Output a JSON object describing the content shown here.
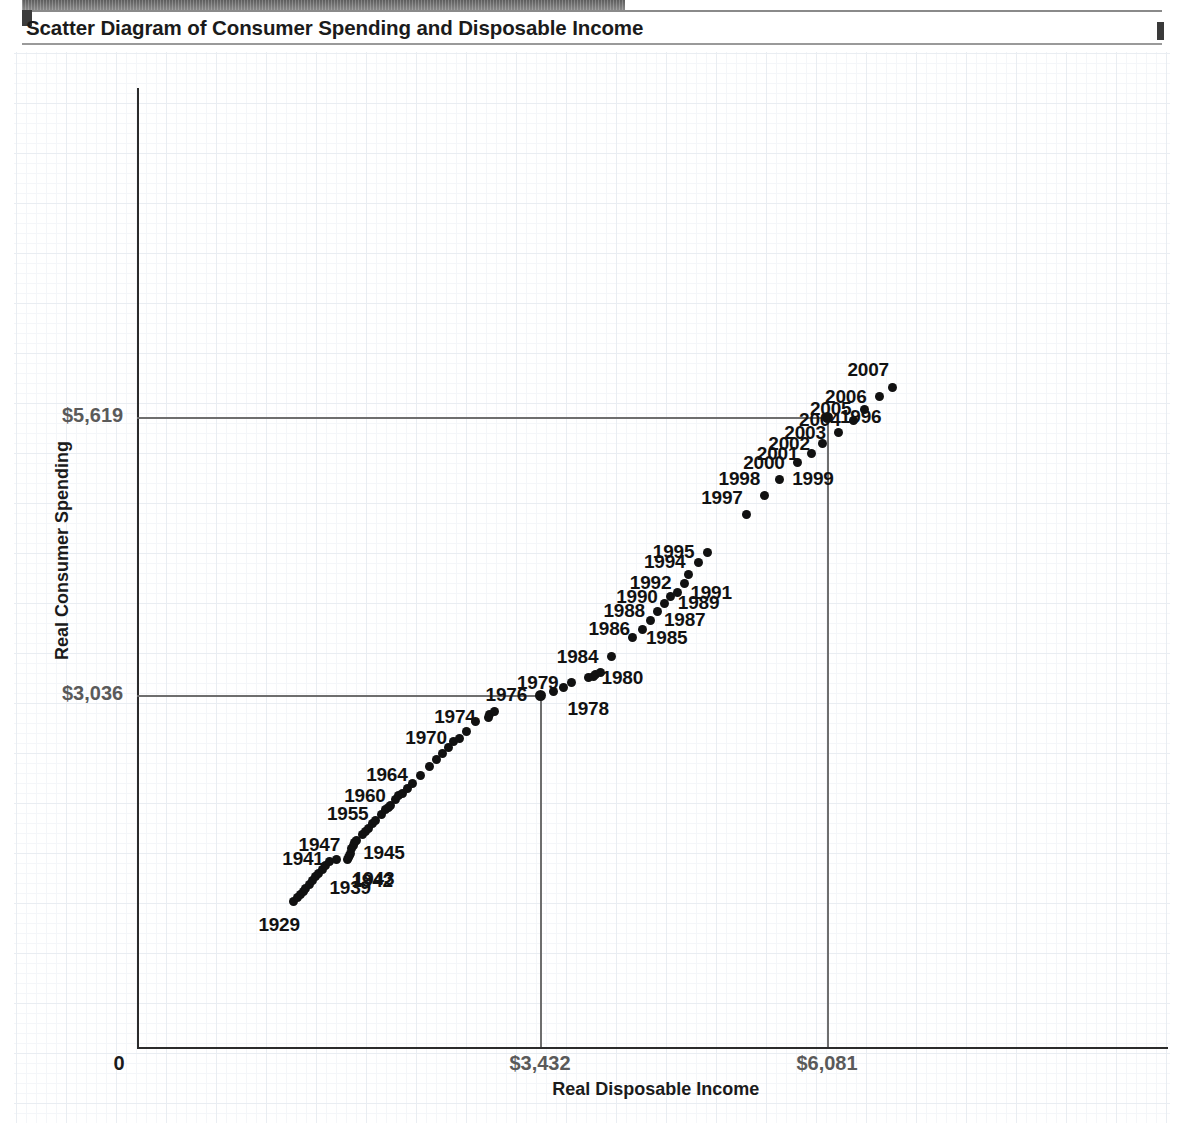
{
  "page": {
    "title": "Scatter Diagram of Consumer Spending and Disposable Income"
  },
  "chart_data": {
    "type": "scatter",
    "title": "Scatter Diagram of Consumer Spending and Disposable Income",
    "xlabel": "Real Disposable Income",
    "ylabel": "Real Consumer Spending",
    "grid": true,
    "legend": "none",
    "xticks": [
      "0",
      "$3,432",
      "$6,081"
    ],
    "xtick_values": [
      0,
      3432,
      6081
    ],
    "yticks": [
      "$3,036",
      "$5,619"
    ],
    "ytick_values": [
      3036,
      5619
    ],
    "xlim": [
      0,
      7400
    ],
    "ylim": [
      0,
      7000
    ],
    "reference_lines": {
      "x": [
        3432,
        6081
      ],
      "y": [
        3036,
        5619
      ]
    },
    "point_color": "#111111",
    "axis_color": "#2b2b2b",
    "grid_color": "#e9edf2",
    "tick_label_color": "#5a5a5a",
    "points": [
      {
        "label": "1929",
        "labeled": true,
        "x": 1160,
        "y": 1118,
        "label_pos": "below-left"
      },
      {
        "label": "1930",
        "labeled": false,
        "x": 1190,
        "y": 1150
      },
      {
        "label": "1931",
        "labeled": false,
        "x": 1218,
        "y": 1180
      },
      {
        "label": "1932",
        "labeled": false,
        "x": 1245,
        "y": 1210
      },
      {
        "label": "1933",
        "labeled": false,
        "x": 1272,
        "y": 1240
      },
      {
        "label": "1934",
        "labeled": false,
        "x": 1300,
        "y": 1275
      },
      {
        "label": "1935",
        "labeled": false,
        "x": 1330,
        "y": 1310
      },
      {
        "label": "1936",
        "labeled": false,
        "x": 1362,
        "y": 1348
      },
      {
        "label": "1937",
        "labeled": false,
        "x": 1392,
        "y": 1382
      },
      {
        "label": "1938",
        "labeled": false,
        "x": 1420,
        "y": 1412
      },
      {
        "label": "1939",
        "labeled": true,
        "x": 1452,
        "y": 1448,
        "label_pos": "below-right"
      },
      {
        "label": "1940",
        "labeled": false,
        "x": 1486,
        "y": 1486
      },
      {
        "label": "1941",
        "labeled": true,
        "x": 1556,
        "y": 1512,
        "label_pos": "left"
      },
      {
        "label": "1942",
        "labeled": true,
        "x": 1655,
        "y": 1508,
        "label_pos": "below-right"
      },
      {
        "label": "1943",
        "labeled": true,
        "x": 1668,
        "y": 1528,
        "label_pos": "below-right"
      },
      {
        "label": "1944",
        "labeled": false,
        "x": 1676,
        "y": 1546
      },
      {
        "label": "1945",
        "labeled": true,
        "x": 1680,
        "y": 1566,
        "label_pos": "right"
      },
      {
        "label": "1946",
        "labeled": false,
        "x": 1695,
        "y": 1610
      },
      {
        "label": "1947",
        "labeled": true,
        "x": 1706,
        "y": 1640,
        "label_pos": "left"
      },
      {
        "label": "1948",
        "labeled": false,
        "x": 1724,
        "y": 1662
      },
      {
        "label": "1949",
        "labeled": false,
        "x": 1742,
        "y": 1684
      },
      {
        "label": "1950",
        "labeled": false,
        "x": 1790,
        "y": 1740
      },
      {
        "label": "1951",
        "labeled": false,
        "x": 1820,
        "y": 1770
      },
      {
        "label": "1952",
        "labeled": false,
        "x": 1850,
        "y": 1800
      },
      {
        "label": "1953",
        "labeled": false,
        "x": 1885,
        "y": 1838
      },
      {
        "label": "1954",
        "labeled": false,
        "x": 1912,
        "y": 1868
      },
      {
        "label": "1955",
        "labeled": true,
        "x": 1968,
        "y": 1930,
        "label_pos": "left"
      },
      {
        "label": "1956",
        "labeled": false,
        "x": 2008,
        "y": 1968
      },
      {
        "label": "1957",
        "labeled": false,
        "x": 2030,
        "y": 1992
      },
      {
        "label": "1958",
        "labeled": false,
        "x": 2048,
        "y": 2012
      },
      {
        "label": "1959",
        "labeled": false,
        "x": 2098,
        "y": 2068
      },
      {
        "label": "1960",
        "labeled": true,
        "x": 2128,
        "y": 2098,
        "label_pos": "left"
      },
      {
        "label": "1961",
        "labeled": false,
        "x": 2160,
        "y": 2124
      },
      {
        "label": "1962",
        "labeled": false,
        "x": 2205,
        "y": 2168
      },
      {
        "label": "1963",
        "labeled": false,
        "x": 2255,
        "y": 2216
      },
      {
        "label": "1964",
        "labeled": true,
        "x": 2330,
        "y": 2290,
        "label_pos": "left"
      },
      {
        "label": "1965",
        "labeled": false,
        "x": 2410,
        "y": 2368
      },
      {
        "label": "1966",
        "labeled": false,
        "x": 2478,
        "y": 2440
      },
      {
        "label": "1967",
        "labeled": false,
        "x": 2528,
        "y": 2488
      },
      {
        "label": "1968",
        "labeled": false,
        "x": 2586,
        "y": 2552
      },
      {
        "label": "1969",
        "labeled": false,
        "x": 2632,
        "y": 2600
      },
      {
        "label": "1970",
        "labeled": true,
        "x": 2692,
        "y": 2636,
        "label_pos": "left"
      },
      {
        "label": "1971",
        "labeled": false,
        "x": 2756,
        "y": 2700
      },
      {
        "label": "1972",
        "labeled": false,
        "x": 2838,
        "y": 2790
      },
      {
        "label": "1973",
        "labeled": false,
        "x": 2962,
        "y": 2858
      },
      {
        "label": "1974",
        "labeled": true,
        "x": 2958,
        "y": 2830,
        "label_pos": "left"
      },
      {
        "label": "1975",
        "labeled": false,
        "x": 3010,
        "y": 2886
      },
      {
        "label": "1976",
        "labeled": true,
        "x": 3432,
        "y": 3036,
        "label_pos": "left",
        "on_gridline": true
      },
      {
        "label": "1977",
        "labeled": false,
        "x": 3560,
        "y": 3072
      },
      {
        "label": "1978",
        "labeled": true,
        "x": 3648,
        "y": 3108,
        "label_pos": "below-right"
      },
      {
        "label": "1979",
        "labeled": true,
        "x": 3722,
        "y": 3152,
        "label_pos": "left"
      },
      {
        "label": "1980",
        "labeled": true,
        "x": 3880,
        "y": 3196,
        "label_pos": "right"
      },
      {
        "label": "1981",
        "labeled": false,
        "x": 3930,
        "y": 3212
      },
      {
        "label": "1982",
        "labeled": false,
        "x": 3946,
        "y": 3224
      },
      {
        "label": "1983",
        "labeled": false,
        "x": 3990,
        "y": 3244
      },
      {
        "label": "1984",
        "labeled": true,
        "x": 4090,
        "y": 3392,
        "label_pos": "left"
      },
      {
        "label": "1985",
        "labeled": true,
        "x": 4290,
        "y": 3570,
        "label_pos": "right"
      },
      {
        "label": "1986",
        "labeled": true,
        "x": 4382,
        "y": 3648,
        "label_pos": "left"
      },
      {
        "label": "1987",
        "labeled": true,
        "x": 4456,
        "y": 3730,
        "label_pos": "right"
      },
      {
        "label": "1988",
        "labeled": true,
        "x": 4520,
        "y": 3812,
        "label_pos": "left"
      },
      {
        "label": "1989",
        "labeled": true,
        "x": 4584,
        "y": 3890,
        "label_pos": "right"
      },
      {
        "label": "1990",
        "labeled": true,
        "x": 4638,
        "y": 3950,
        "label_pos": "left"
      },
      {
        "label": "1991",
        "labeled": true,
        "x": 4700,
        "y": 3986,
        "label_pos": "right"
      },
      {
        "label": "1992",
        "labeled": true,
        "x": 4764,
        "y": 4076,
        "label_pos": "left"
      },
      {
        "label": "1993",
        "labeled": false,
        "x": 4802,
        "y": 4156
      },
      {
        "label": "1994",
        "labeled": true,
        "x": 4894,
        "y": 4268,
        "label_pos": "left"
      },
      {
        "label": "1995",
        "labeled": true,
        "x": 4976,
        "y": 4364,
        "label_pos": "left"
      },
      {
        "label": "1996",
        "labeled": true,
        "x": 6081,
        "y": 5619,
        "label_pos": "right",
        "on_gridline": true
      },
      {
        "label": "1997",
        "labeled": true,
        "x": 5340,
        "y": 4710,
        "label_pos": "above-left"
      },
      {
        "label": "1998",
        "labeled": true,
        "x": 5500,
        "y": 4886,
        "label_pos": "above-left"
      },
      {
        "label": "1999",
        "labeled": true,
        "x": 5640,
        "y": 5040,
        "label_pos": "right"
      },
      {
        "label": "2000",
        "labeled": true,
        "x": 5810,
        "y": 5196,
        "label_pos": "left"
      },
      {
        "label": "2001",
        "labeled": true,
        "x": 5936,
        "y": 5276,
        "label_pos": "left"
      },
      {
        "label": "2002",
        "labeled": true,
        "x": 6042,
        "y": 5370,
        "label_pos": "left"
      },
      {
        "label": "2003",
        "labeled": true,
        "x": 6190,
        "y": 5474,
        "label_pos": "left"
      },
      {
        "label": "2004",
        "labeled": true,
        "x": 6326,
        "y": 5588,
        "label_pos": "left"
      },
      {
        "label": "2005",
        "labeled": true,
        "x": 6426,
        "y": 5690,
        "label_pos": "left"
      },
      {
        "label": "2006",
        "labeled": true,
        "x": 6566,
        "y": 5808,
        "label_pos": "left"
      },
      {
        "label": "2007",
        "labeled": true,
        "x": 6690,
        "y": 5896,
        "label_pos": "above-left"
      }
    ]
  }
}
